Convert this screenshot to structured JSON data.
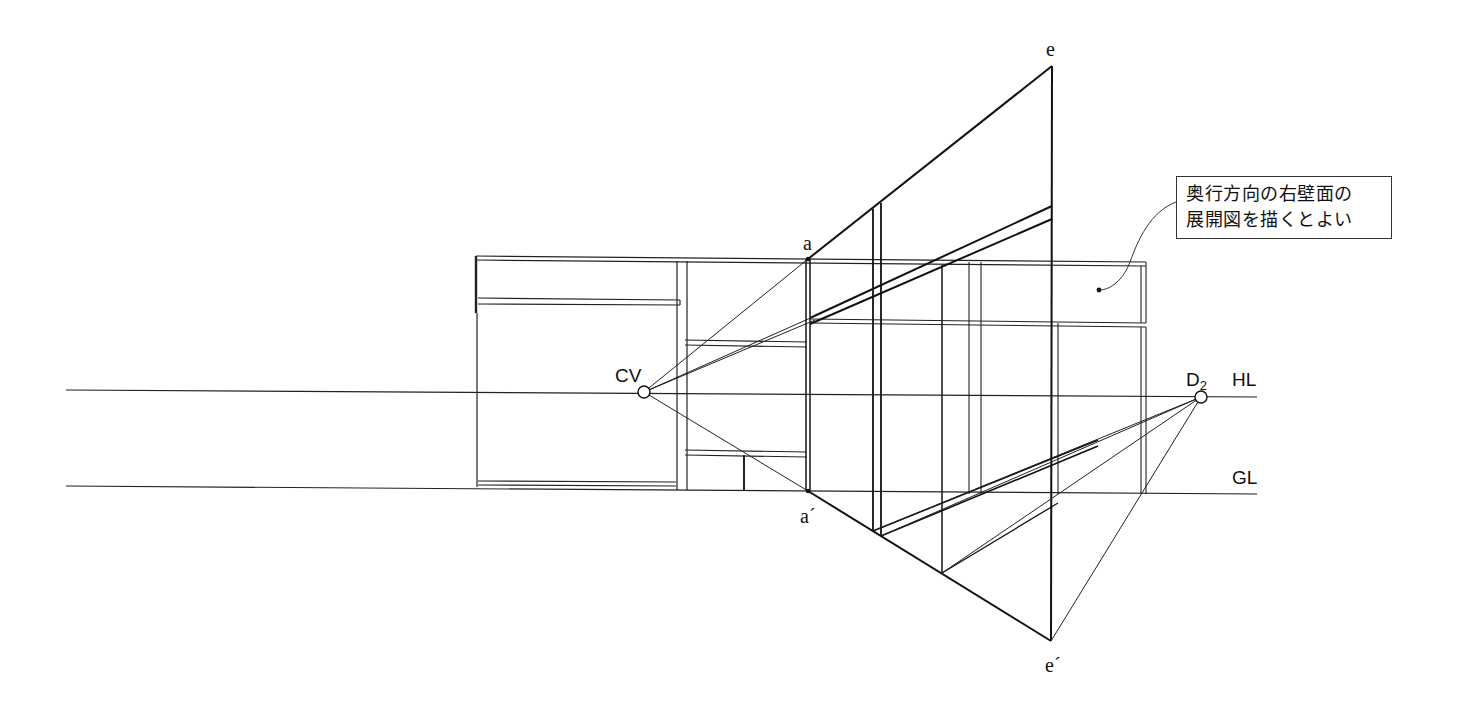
{
  "diagram": {
    "type": "one-point perspective construction (interior right wall elevation unfolding)",
    "lines": {
      "horizon_line": {
        "label": "HL",
        "y": 392
      },
      "ground_line": {
        "label": "GL",
        "y": 488
      }
    },
    "points": {
      "center_of_vision": {
        "label": "CV",
        "x": 644,
        "y": 392
      },
      "distance_point": {
        "label": "D",
        "subscript": "2",
        "x": 1201,
        "y": 397
      },
      "a": {
        "label": "a",
        "x": 808,
        "y": 259
      },
      "a_prime": {
        "label": "a´",
        "x": 808,
        "y": 491
      },
      "e": {
        "label": "e",
        "x": 1052,
        "y": 66
      },
      "e_prime": {
        "label": "e´",
        "x": 1051,
        "y": 641
      }
    },
    "note": {
      "line1": "奥行方向の右壁面の",
      "line2": "展開図を描くとよい"
    },
    "colors": {
      "ink": "#111111",
      "paper": "#ffffff",
      "thin_ink": "#333333"
    }
  }
}
